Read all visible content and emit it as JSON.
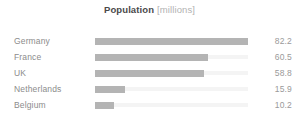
{
  "chart_data": {
    "type": "bar",
    "orientation": "horizontal",
    "title": "Population",
    "unit_label": "[millions]",
    "xlabel": "",
    "ylabel": "",
    "categories": [
      "Germany",
      "France",
      "UK",
      "Netherlands",
      "Belgium"
    ],
    "values": [
      82.2,
      60.5,
      58.8,
      15.9,
      10.2
    ],
    "value_labels": [
      "82.2",
      "60.5",
      "58.8",
      "15.9",
      "10.2"
    ],
    "xlim": [
      0,
      82.2
    ],
    "grid": false,
    "legend": "none",
    "colors": {
      "bar_fill": "#b4b4b4",
      "bar_track": "#f4f4f4",
      "label_text": "#8c8c8c",
      "value_text": "#9a9a9a",
      "title_text": "#4a4a4a",
      "unit_text": "#b2b2b2",
      "background": "#ffffff"
    }
  }
}
